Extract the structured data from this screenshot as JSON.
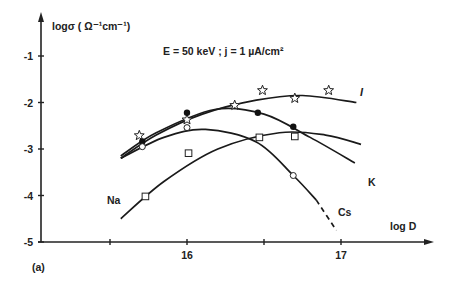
{
  "chart_data": {
    "type": "line",
    "title": "E = 50 keV ; j = 1 µA/cm²",
    "panel_label": "(a)",
    "xlabel": "log D",
    "ylabel": "logσ ( Ω⁻¹cm⁻¹)",
    "xlim": [
      15.0,
      17.6
    ],
    "ylim": [
      -5,
      -0.3
    ],
    "x_ticks": [
      15.5,
      16,
      16.5,
      17
    ],
    "x_tick_labels": [
      "",
      "16",
      "",
      "17"
    ],
    "y_ticks": [
      -1,
      -2,
      -3,
      -4,
      -5
    ],
    "y_tick_labels": [
      "-1",
      "-2",
      "-3",
      "-4",
      "-5"
    ],
    "grid": false,
    "legend": "curve labels placed at line ends",
    "series": [
      {
        "name": "I",
        "marker": "star",
        "points": [
          {
            "x": 15.69,
            "y": -2.71
          },
          {
            "x": 16.0,
            "y": -2.37
          },
          {
            "x": 16.31,
            "y": -2.06
          },
          {
            "x": 16.49,
            "y": -1.74
          },
          {
            "x": 16.7,
            "y": -1.91
          },
          {
            "x": 16.92,
            "y": -1.74
          }
        ],
        "curve": [
          {
            "x": 15.57,
            "y": -3.2
          },
          {
            "x": 15.8,
            "y": -2.7
          },
          {
            "x": 16.1,
            "y": -2.25
          },
          {
            "x": 16.45,
            "y": -1.95
          },
          {
            "x": 16.75,
            "y": -1.85
          },
          {
            "x": 17.1,
            "y": -2.0
          }
        ]
      },
      {
        "name": "K",
        "marker": "filled-circle",
        "points": [
          {
            "x": 15.71,
            "y": -2.84
          },
          {
            "x": 16.0,
            "y": -2.22
          },
          {
            "x": 16.46,
            "y": -2.22
          },
          {
            "x": 16.69,
            "y": -2.52
          }
        ],
        "curve": [
          {
            "x": 15.57,
            "y": -3.15
          },
          {
            "x": 15.8,
            "y": -2.65
          },
          {
            "x": 16.18,
            "y": -2.15
          },
          {
            "x": 16.5,
            "y": -2.25
          },
          {
            "x": 16.8,
            "y": -2.75
          },
          {
            "x": 17.09,
            "y": -3.3
          }
        ]
      },
      {
        "name": "Cs",
        "marker": "open-circle",
        "points": [
          {
            "x": 15.71,
            "y": -2.95
          },
          {
            "x": 16.0,
            "y": -2.54
          },
          {
            "x": 16.69,
            "y": -3.57
          }
        ],
        "curve": [
          {
            "x": 15.57,
            "y": -3.2
          },
          {
            "x": 15.85,
            "y": -2.75
          },
          {
            "x": 16.12,
            "y": -2.58
          },
          {
            "x": 16.45,
            "y": -2.85
          },
          {
            "x": 16.69,
            "y": -3.57
          },
          {
            "x": 16.84,
            "y": -4.1
          }
        ],
        "dashed_extension": [
          {
            "x": 16.84,
            "y": -4.1
          },
          {
            "x": 16.97,
            "y": -4.75
          }
        ]
      },
      {
        "name": "Na",
        "marker": "open-square",
        "points": [
          {
            "x": 15.73,
            "y": -4.02
          },
          {
            "x": 16.01,
            "y": -3.09
          },
          {
            "x": 16.47,
            "y": -2.75
          },
          {
            "x": 16.7,
            "y": -2.73
          }
        ],
        "curve": [
          {
            "x": 15.57,
            "y": -4.5
          },
          {
            "x": 15.85,
            "y": -3.7
          },
          {
            "x": 16.2,
            "y": -3.0
          },
          {
            "x": 16.6,
            "y": -2.65
          },
          {
            "x": 16.9,
            "y": -2.7
          },
          {
            "x": 17.13,
            "y": -2.9
          }
        ]
      }
    ]
  }
}
